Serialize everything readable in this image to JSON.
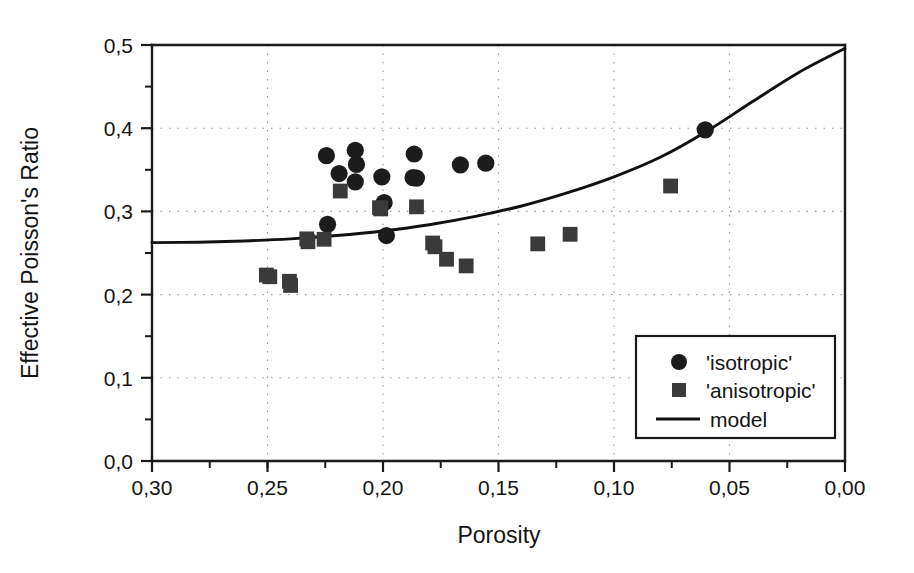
{
  "chart_data": {
    "type": "scatter",
    "title": "",
    "xlabel": "Porosity",
    "ylabel": "Effective Poisson's Ratio",
    "xlim": [
      0.3,
      0.0
    ],
    "ylim": [
      0.0,
      0.5
    ],
    "x_axis_reversed": true,
    "grid": "dotted",
    "legend_position": "lower-right",
    "x_ticks": [
      "0,30",
      "0,25",
      "0,20",
      "0,15",
      "0,10",
      "0,05",
      "0,00"
    ],
    "x_tick_values": [
      0.3,
      0.25,
      0.2,
      0.15,
      0.1,
      0.05,
      0.0
    ],
    "x_minor_step": 0.025,
    "y_ticks": [
      "0,0",
      "0,1",
      "0,2",
      "0,3",
      "0,4",
      "0,5"
    ],
    "y_tick_values": [
      0.0,
      0.1,
      0.2,
      0.3,
      0.4,
      0.5
    ],
    "y_minor_step": 0.05,
    "decimal_separator": ",",
    "series": [
      {
        "name": "'isotropic'",
        "marker": "circle",
        "color": "#1c1c1c",
        "points": [
          [
            0.2245,
            0.367
          ],
          [
            0.219,
            0.3455
          ],
          [
            0.224,
            0.2845
          ],
          [
            0.212,
            0.3735
          ],
          [
            0.2115,
            0.3565
          ],
          [
            0.212,
            0.3355
          ],
          [
            0.2005,
            0.3415
          ],
          [
            0.1995,
            0.3105
          ],
          [
            0.1985,
            0.271
          ],
          [
            0.187,
            0.3405
          ],
          [
            0.1865,
            0.369
          ],
          [
            0.1855,
            0.34
          ],
          [
            0.1665,
            0.356
          ],
          [
            0.1555,
            0.358
          ],
          [
            0.0605,
            0.398
          ]
        ]
      },
      {
        "name": "'anisotropic'",
        "marker": "square",
        "color": "#3a3a3a",
        "points": [
          [
            0.2505,
            0.2235
          ],
          [
            0.249,
            0.2215
          ],
          [
            0.2405,
            0.216
          ],
          [
            0.24,
            0.211
          ],
          [
            0.233,
            0.267
          ],
          [
            0.2325,
            0.2635
          ],
          [
            0.2255,
            0.2665
          ],
          [
            0.2185,
            0.3245
          ],
          [
            0.2015,
            0.3045
          ],
          [
            0.201,
            0.303
          ],
          [
            0.1855,
            0.3055
          ],
          [
            0.1785,
            0.262
          ],
          [
            0.1775,
            0.2575
          ],
          [
            0.1725,
            0.2425
          ],
          [
            0.164,
            0.2345
          ],
          [
            0.133,
            0.261
          ],
          [
            0.119,
            0.2725
          ],
          [
            0.0755,
            0.3305
          ]
        ]
      }
    ],
    "model": {
      "name": "model",
      "color": "#111111",
      "description": "monotonic curve rising from left to right as porosity decreases",
      "points": [
        [
          0.3,
          0.2625
        ],
        [
          0.28,
          0.263
        ],
        [
          0.26,
          0.2645
        ],
        [
          0.24,
          0.267
        ],
        [
          0.22,
          0.271
        ],
        [
          0.2,
          0.2765
        ],
        [
          0.18,
          0.284
        ],
        [
          0.16,
          0.294
        ],
        [
          0.14,
          0.3065
        ],
        [
          0.12,
          0.3225
        ],
        [
          0.1,
          0.3415
        ],
        [
          0.08,
          0.365
        ],
        [
          0.06,
          0.396
        ],
        [
          0.04,
          0.432
        ],
        [
          0.02,
          0.467
        ],
        [
          0.0,
          0.496
        ]
      ]
    }
  },
  "legend": {
    "entries": [
      {
        "label": "'isotropic'",
        "marker": "circle"
      },
      {
        "label": "'anisotropic'",
        "marker": "square"
      },
      {
        "label": "model",
        "marker": "line"
      }
    ]
  },
  "axes": {
    "x_title": "Porosity",
    "y_title": "Effective Poisson's Ratio"
  }
}
